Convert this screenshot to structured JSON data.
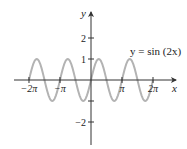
{
  "chart_data": {
    "type": "line",
    "title": "",
    "xlabel": "x",
    "ylabel": "y",
    "annotation": "y = sin (2x)",
    "function": "sin(2x)",
    "x_range": [
      -6.2832,
      6.2832
    ],
    "xlim": [
      -7.5,
      7.8
    ],
    "ylim": [
      -3.3,
      3.8
    ],
    "x_ticks": [
      {
        "value": -6.2832,
        "label": "−2π"
      },
      {
        "value": -3.1416,
        "label": "−π"
      },
      {
        "value": 3.1416,
        "label": "π"
      },
      {
        "value": 6.2832,
        "label": "2π"
      }
    ],
    "y_ticks": [
      {
        "value": 2,
        "label": "2"
      },
      {
        "value": 1,
        "label": "1"
      },
      {
        "value": -1,
        "label": ""
      },
      {
        "value": -2,
        "label": "−2"
      }
    ],
    "series": [
      {
        "name": "y = sin(2x)",
        "color": "#b3b3b3",
        "samples": 241
      }
    ],
    "grid": false,
    "legend": "none"
  },
  "colors": {
    "axis": "#333333",
    "curve": "#b3b3b3",
    "text": "#222222"
  }
}
